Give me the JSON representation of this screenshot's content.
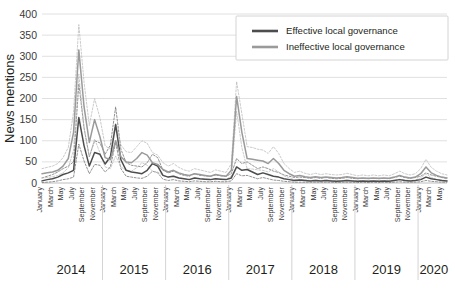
{
  "chart_data": {
    "type": "line",
    "title": "",
    "xlabel": "",
    "ylabel": "News mentions",
    "ylim": [
      0,
      400
    ],
    "yticks": [
      0,
      50,
      100,
      150,
      200,
      250,
      300,
      350,
      400
    ],
    "grid": true,
    "legend_position": "top-right",
    "legend_entries": [
      "Effective local governance",
      "Ineffective local governance"
    ],
    "colors": {
      "effective": "#4d4d4d",
      "ineffective": "#9a9a9a",
      "effective_ci": "#6e6e6e",
      "ineffective_ci": "#b9b9b9",
      "gridline": "#d8d8d8",
      "axis_text": "#231f20"
    },
    "years": [
      "2014",
      "2015",
      "2016",
      "2017",
      "2018",
      "2019",
      "2020"
    ],
    "year_month_counts": [
      12,
      12,
      12,
      12,
      12,
      12,
      6
    ],
    "month_tick_labels": [
      "January",
      "March",
      "May",
      "July",
      "September",
      "November"
    ],
    "x_labels": [
      "January",
      "March",
      "May",
      "July",
      "September",
      "November",
      "January",
      "March",
      "May",
      "July",
      "September",
      "November",
      "January",
      "March",
      "May",
      "July",
      "September",
      "November",
      "January",
      "March",
      "May",
      "July",
      "September",
      "November",
      "January",
      "March",
      "May",
      "July",
      "September",
      "November",
      "January",
      "March",
      "May",
      "July",
      "September",
      "November",
      "January",
      "March",
      "May"
    ],
    "series": [
      {
        "name": "Effective local governance",
        "color": "#4d4d4d",
        "values": [
          5,
          8,
          10,
          14,
          20,
          24,
          30,
          155,
          88,
          40,
          72,
          68,
          45,
          62,
          138,
          55,
          30,
          26,
          24,
          22,
          30,
          46,
          40,
          18,
          14,
          16,
          12,
          10,
          8,
          12,
          10,
          9,
          8,
          10,
          9,
          8,
          12,
          38,
          30,
          32,
          26,
          20,
          24,
          20,
          16,
          14,
          10,
          8,
          6,
          7,
          6,
          5,
          6,
          5,
          6,
          5,
          4,
          5,
          6,
          5,
          4,
          5,
          4,
          5,
          4,
          5,
          4,
          6,
          8,
          6,
          5,
          6,
          8,
          14,
          10,
          8,
          6,
          5
        ],
        "ci_upper": [
          12,
          16,
          20,
          26,
          34,
          40,
          50,
          235,
          130,
          62,
          100,
          95,
          68,
          90,
          180,
          80,
          48,
          42,
          40,
          38,
          48,
          68,
          60,
          30,
          24,
          28,
          22,
          18,
          16,
          22,
          18,
          17,
          16,
          19,
          17,
          16,
          22,
          58,
          46,
          50,
          42,
          34,
          38,
          34,
          28,
          25,
          19,
          16,
          13,
          14,
          13,
          11,
          13,
          11,
          13,
          11,
          10,
          11,
          13,
          11,
          10,
          11,
          10,
          11,
          10,
          11,
          10,
          13,
          16,
          13,
          11,
          13,
          16,
          24,
          19,
          16,
          13,
          11
        ],
        "ci_lower": [
          1,
          2,
          3,
          5,
          8,
          10,
          14,
          92,
          52,
          22,
          44,
          42,
          26,
          38,
          96,
          34,
          16,
          14,
          12,
          11,
          16,
          28,
          24,
          9,
          6,
          8,
          5,
          4,
          3,
          5,
          4,
          3,
          3,
          4,
          3,
          3,
          5,
          22,
          17,
          18,
          14,
          10,
          13,
          10,
          7,
          6,
          4,
          3,
          2,
          2,
          2,
          2,
          2,
          2,
          2,
          2,
          1,
          2,
          2,
          2,
          1,
          2,
          1,
          2,
          1,
          2,
          1,
          2,
          3,
          2,
          2,
          2,
          3,
          6,
          4,
          3,
          2,
          2
        ]
      },
      {
        "name": "Ineffective local governance",
        "color": "#9a9a9a",
        "values": [
          22,
          24,
          26,
          30,
          40,
          58,
          120,
          315,
          180,
          96,
          150,
          110,
          60,
          55,
          100,
          62,
          50,
          48,
          58,
          72,
          66,
          48,
          44,
          32,
          26,
          30,
          24,
          20,
          18,
          22,
          20,
          18,
          16,
          20,
          18,
          16,
          30,
          205,
          120,
          58,
          56,
          54,
          52,
          46,
          58,
          46,
          30,
          22,
          16,
          18,
          15,
          13,
          15,
          13,
          14,
          13,
          12,
          13,
          15,
          13,
          11,
          12,
          11,
          12,
          11,
          12,
          11,
          14,
          18,
          14,
          12,
          14,
          22,
          38,
          24,
          18,
          14,
          12
        ],
        "ci_upper": [
          34,
          37,
          40,
          46,
          60,
          84,
          168,
          375,
          238,
          136,
          200,
          155,
          88,
          80,
          142,
          90,
          74,
          72,
          86,
          100,
          94,
          72,
          66,
          48,
          40,
          46,
          37,
          31,
          28,
          34,
          31,
          28,
          25,
          31,
          28,
          25,
          46,
          240,
          164,
          86,
          84,
          80,
          78,
          70,
          86,
          70,
          46,
          34,
          25,
          28,
          23,
          20,
          23,
          20,
          22,
          20,
          19,
          20,
          23,
          20,
          17,
          19,
          17,
          19,
          17,
          19,
          17,
          22,
          28,
          22,
          19,
          22,
          34,
          56,
          37,
          28,
          22,
          19
        ],
        "ci_lower": [
          12,
          13,
          15,
          18,
          24,
          36,
          78,
          258,
          130,
          62,
          104,
          72,
          38,
          34,
          64,
          38,
          30,
          28,
          36,
          48,
          42,
          28,
          26,
          18,
          14,
          17,
          13,
          10,
          9,
          12,
          10,
          9,
          8,
          10,
          9,
          8,
          17,
          170,
          84,
          34,
          33,
          31,
          30,
          26,
          34,
          26,
          17,
          12,
          8,
          9,
          7,
          6,
          7,
          6,
          7,
          6,
          5,
          6,
          7,
          6,
          5,
          5,
          5,
          5,
          5,
          5,
          5,
          7,
          9,
          7,
          6,
          7,
          12,
          22,
          13,
          9,
          7,
          6
        ]
      }
    ]
  }
}
